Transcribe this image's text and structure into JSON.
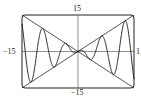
{
  "chart_data": {
    "type": "line",
    "title": "",
    "xlabel": "",
    "ylabel": "",
    "xlim": [
      -15,
      15
    ],
    "ylim": [
      -15,
      15
    ],
    "tick_labels": {
      "x_min": "−15",
      "x_max": "15",
      "y_max": "15",
      "y_min": "−15"
    },
    "grid": false,
    "series": [
      {
        "name": "y = x",
        "formula": "x"
      },
      {
        "name": "y = -x",
        "formula": "-x"
      },
      {
        "name": "y = x cos(x)",
        "formula": "x*cos(x)"
      }
    ]
  },
  "labels": {
    "top": "15",
    "bottom": "−15",
    "left": "−15",
    "right": "1"
  }
}
